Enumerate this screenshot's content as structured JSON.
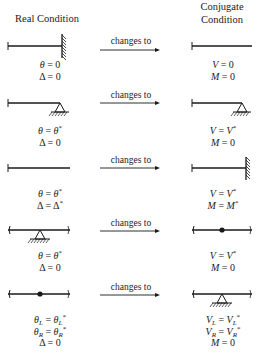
{
  "headers": {
    "real": "Real Condition",
    "conjugate_line1": "Conjugate",
    "conjugate_line2": "Condition"
  },
  "arrow_label": "changes to",
  "rows": [
    {
      "real_support": "fixed-end-right",
      "conjugate_support": "free-end-right",
      "real_eq": [
        "θ = 0",
        "Δ = 0"
      ],
      "conjugate_eq": [
        "V = 0",
        "M = 0"
      ]
    },
    {
      "real_support": "pin-end-right",
      "conjugate_support": "pin-end-right",
      "real_eq": [
        "θ = θ*",
        "Δ = 0"
      ],
      "conjugate_eq": [
        "V = V*",
        "M = 0"
      ]
    },
    {
      "real_support": "free-end-right",
      "conjugate_support": "fixed-end-right",
      "real_eq": [
        "θ = θ*",
        "Δ = Δ*"
      ],
      "conjugate_eq": [
        "V = V*",
        "M = M*"
      ]
    },
    {
      "real_support": "interior-pin",
      "conjugate_support": "interior-hinge",
      "real_eq": [
        "θ = θ*",
        "Δ = 0"
      ],
      "conjugate_eq": [
        "V = V*",
        "M = 0"
      ]
    },
    {
      "real_support": "interior-hinge",
      "conjugate_support": "interior-pin",
      "real_eq": [
        "θL = θL*",
        "θR = θR*",
        "Δ = 0"
      ],
      "conjugate_eq": [
        "VL = VL*",
        "VR = VR*",
        "M = 0"
      ]
    }
  ]
}
